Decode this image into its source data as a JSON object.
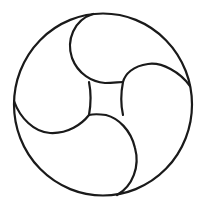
{
  "figure": {
    "stroke_color": "#1a1a1a",
    "background_color": "#ffffff",
    "outer_circle": {
      "cx": 103,
      "cy": 104.5,
      "rx": 89,
      "ry": 91
    },
    "central_square_corners": [
      [
        89,
        82
      ],
      [
        123,
        82
      ],
      [
        123,
        115
      ],
      [
        89,
        115
      ]
    ],
    "comma_count": 4
  }
}
